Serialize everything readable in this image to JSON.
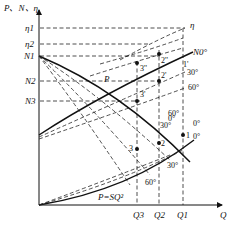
{
  "diagram": {
    "type": "fan performance curves with inlet guide vane angle control",
    "axes": {
      "y_label": "P、N、η",
      "x_label": "Q",
      "y_ticks": [
        "η1",
        "η2",
        "N1",
        "N2",
        "N3"
      ],
      "x_ticks": [
        "Q3",
        "Q2",
        "Q1"
      ]
    },
    "curves": {
      "pressure_label": "P",
      "system_label": "P=SQ²",
      "power_label": "N0°",
      "efficiency_label": "η"
    },
    "angle_labels": {
      "power": [
        "30°",
        "60°"
      ],
      "pressure": [
        "0°",
        "30°",
        "60°"
      ],
      "pressure_lower": [
        "0°",
        "30°",
        "60°"
      ]
    },
    "points": {
      "operating": [
        "1",
        "2",
        "3"
      ],
      "power": [
        "1'",
        "2'",
        "3'"
      ],
      "efficiency": [
        "2''",
        "3''"
      ]
    },
    "colors": {
      "line": "#111111",
      "background": "#ffffff"
    }
  }
}
